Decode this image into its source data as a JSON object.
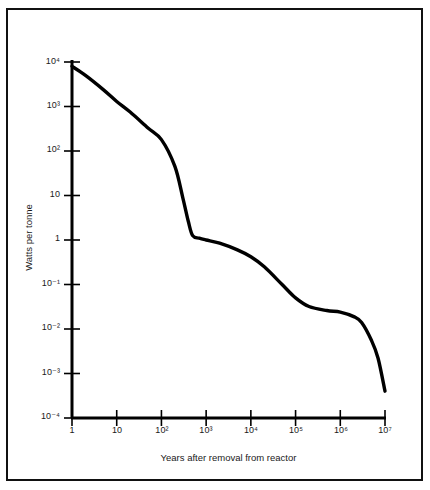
{
  "figure": {
    "border_color": "#111111",
    "background": "#ffffff",
    "curve_color": "#000000"
  },
  "chart_data": {
    "type": "line",
    "title": "",
    "subtitle": "",
    "xlabel": "Years after removal from reactor",
    "ylabel": "Watts per tonne",
    "xscale": "log",
    "yscale": "log",
    "xlim": [
      1,
      10000000
    ],
    "ylim": [
      0.0001,
      10000
    ],
    "grid": false,
    "legend": null,
    "x_tick_labels": [
      "1",
      "10",
      "10²",
      "10³",
      "10⁴",
      "10⁵",
      "10⁶",
      "10⁷"
    ],
    "x_tick_values": [
      1,
      10,
      100,
      1000,
      10000,
      100000,
      1000000,
      10000000
    ],
    "y_tick_labels": [
      "10⁴",
      "10³",
      "10²",
      "10",
      "1",
      "10⁻¹",
      "10⁻²",
      "10⁻³",
      "10⁻⁴"
    ],
    "y_tick_values": [
      10000,
      1000,
      100,
      10,
      1,
      0.1,
      0.01,
      0.001,
      0.0001
    ],
    "series": [
      {
        "name": "Decay heat",
        "x": [
          1,
          2,
          5,
          10,
          20,
          50,
          100,
          200,
          300,
          400,
          500,
          700,
          1000,
          2000,
          5000,
          10000,
          20000,
          50000,
          100000,
          200000,
          500000,
          1000000,
          2000000,
          3000000,
          5000000,
          7000000,
          10000000
        ],
        "y": [
          8000,
          5000,
          2400,
          1300,
          750,
          330,
          180,
          45,
          9,
          2.6,
          1.25,
          1.1,
          1.0,
          0.85,
          0.6,
          0.42,
          0.25,
          0.1,
          0.05,
          0.032,
          0.026,
          0.024,
          0.019,
          0.014,
          0.0055,
          0.0022,
          0.0004
        ]
      }
    ],
    "annotations": []
  },
  "axis_titles": {
    "y": "Watts per tonne",
    "x": "Years after removal from reactor"
  }
}
